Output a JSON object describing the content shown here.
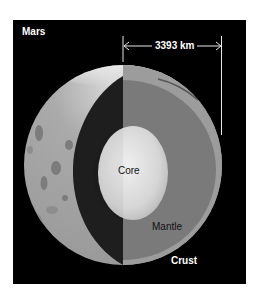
{
  "diagram": {
    "title": "Mars",
    "dimension": {
      "label": "3393 km",
      "description": "radius arrow from center line to right edge"
    },
    "layers": [
      {
        "name": "Core",
        "label": "Core"
      },
      {
        "name": "Mantle",
        "label": "Mantle"
      },
      {
        "name": "Crust",
        "label": "Crust"
      }
    ],
    "colors": {
      "background": "#000000",
      "surface": "#a6a6a6",
      "crust": "#9c9c9c",
      "mantle": "#7a7a7a",
      "cutaway_shadow": "#1e1e1e",
      "core": "#dcdcdc",
      "text_dark": "#111111",
      "text_light": "#ffffff"
    }
  }
}
